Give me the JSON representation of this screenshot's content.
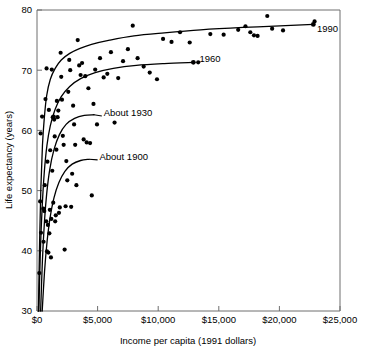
{
  "chart_data": {
    "type": "scatter",
    "title": "",
    "xlabel": "Income per capita (1991 dollars)",
    "ylabel": "Life expectancy (years)",
    "xlim": [
      0,
      25000
    ],
    "ylim": [
      30,
      80
    ],
    "grid": false,
    "legend_position": "inline-curve-labels",
    "x_ticks": [
      0,
      5000,
      10000,
      15000,
      20000,
      25000
    ],
    "x_tick_labels": [
      "$0",
      "$5,000",
      "$10,000",
      "$15,000",
      "$20,000",
      "$25,000"
    ],
    "y_ticks": [
      30,
      40,
      50,
      60,
      70,
      80
    ],
    "y_tick_labels": [
      "30",
      "40",
      "50",
      "60",
      "70",
      "80"
    ],
    "annotations": [
      {
        "text": "1990",
        "x": 23100,
        "y": 76.4
      },
      {
        "text": "1960",
        "x": 13400,
        "y": 71.3
      },
      {
        "text": "About 1930",
        "x": 5500,
        "y": 62.4
      },
      {
        "text": "About 1900",
        "x": 5150,
        "y": 55.1
      }
    ],
    "series": [
      {
        "name": "1990 scatter",
        "type": "scatter",
        "points": [
          [
            190,
            36.3
          ],
          [
            260,
            48.2
          ],
          [
            300,
            59.5
          ],
          [
            330,
            43.0
          ],
          [
            420,
            62.3
          ],
          [
            520,
            47.0
          ],
          [
            540,
            41.5
          ],
          [
            600,
            46.6
          ],
          [
            640,
            50.9
          ],
          [
            700,
            65.2
          ],
          [
            760,
            44.9
          ],
          [
            790,
            70.3
          ],
          [
            820,
            39.9
          ],
          [
            860,
            54.8
          ],
          [
            900,
            44.3
          ],
          [
            940,
            39.7
          ],
          [
            980,
            63.4
          ],
          [
            1020,
            42.9
          ],
          [
            1060,
            46.8
          ],
          [
            1090,
            56.7
          ],
          [
            1150,
            38.9
          ],
          [
            1180,
            45.3
          ],
          [
            1220,
            70.1
          ],
          [
            1260,
            53.3
          ],
          [
            1300,
            62.2
          ],
          [
            1340,
            48.0
          ],
          [
            1380,
            62.3
          ],
          [
            1420,
            61.8
          ],
          [
            1460,
            59.0
          ],
          [
            1500,
            44.9
          ],
          [
            1550,
            45.9
          ],
          [
            1600,
            56.8
          ],
          [
            1640,
            64.9
          ],
          [
            1700,
            62.2
          ],
          [
            1760,
            63.3
          ],
          [
            1810,
            46.3
          ],
          [
            1880,
            47.2
          ],
          [
            1950,
            72.9
          ],
          [
            2000,
            68.9
          ],
          [
            2060,
            65.1
          ],
          [
            2130,
            59.1
          ],
          [
            2200,
            57.6
          ],
          [
            2280,
            40.2
          ],
          [
            2360,
            47.4
          ],
          [
            2420,
            54.9
          ],
          [
            2500,
            51.7
          ],
          [
            2580,
            66.4
          ],
          [
            2660,
            71.7
          ],
          [
            2740,
            70.0
          ],
          [
            2820,
            47.3
          ],
          [
            2900,
            52.8
          ],
          [
            2980,
            64.1
          ],
          [
            3060,
            61.0
          ],
          [
            3150,
            57.6
          ],
          [
            3250,
            50.9
          ],
          [
            3360,
            75.0
          ],
          [
            3480,
            70.8
          ],
          [
            3600,
            69.2
          ],
          [
            3720,
            71.2
          ],
          [
            3850,
            58.5
          ],
          [
            3980,
            69.0
          ],
          [
            4100,
            58.0
          ],
          [
            4240,
            67.0
          ],
          [
            4380,
            57.9
          ],
          [
            4520,
            49.2
          ],
          [
            4660,
            64.4
          ],
          [
            4800,
            70.1
          ],
          [
            4950,
            61.0
          ],
          [
            5200,
            72.0
          ],
          [
            5500,
            68.8
          ],
          [
            5800,
            69.4
          ],
          [
            6100,
            73.0
          ],
          [
            6400,
            61.3
          ],
          [
            6700,
            68.7
          ],
          [
            7100,
            71.5
          ],
          [
            7500,
            73.5
          ],
          [
            7900,
            77.4
          ],
          [
            8300,
            72.0
          ],
          [
            8800,
            70.6
          ],
          [
            9300,
            69.6
          ],
          [
            9900,
            68.5
          ],
          [
            10400,
            75.2
          ],
          [
            11100,
            74.7
          ],
          [
            11800,
            76.3
          ],
          [
            12600,
            74.6
          ],
          [
            13300,
            71.3
          ],
          [
            14300,
            76.0
          ],
          [
            15400,
            75.9
          ],
          [
            16600,
            76.7
          ],
          [
            17200,
            77.3
          ],
          [
            17600,
            76.3
          ],
          [
            17900,
            75.8
          ],
          [
            18200,
            75.7
          ],
          [
            19000,
            79.0
          ],
          [
            19400,
            76.9
          ],
          [
            20300,
            76.6
          ],
          [
            22900,
            78.1
          ]
        ]
      },
      {
        "name": "1990 fitted curve",
        "type": "line",
        "points": [
          [
            120,
            30.0
          ],
          [
            220,
            42.0
          ],
          [
            320,
            50.5
          ],
          [
            450,
            57.5
          ],
          [
            600,
            62.0
          ],
          [
            800,
            65.8
          ],
          [
            1100,
            68.5
          ],
          [
            1500,
            70.3
          ],
          [
            2000,
            71.7
          ],
          [
            2700,
            72.8
          ],
          [
            3500,
            73.6
          ],
          [
            4500,
            74.3
          ],
          [
            6000,
            75.0
          ],
          [
            8000,
            75.7
          ],
          [
            10500,
            76.2
          ],
          [
            13500,
            76.7
          ],
          [
            17000,
            77.1
          ],
          [
            20500,
            77.4
          ],
          [
            22800,
            77.6
          ]
        ]
      },
      {
        "name": "1960 fitted curve",
        "type": "line",
        "points": [
          [
            150,
            30.0
          ],
          [
            280,
            40.0
          ],
          [
            420,
            47.0
          ],
          [
            600,
            53.0
          ],
          [
            820,
            57.5
          ],
          [
            1100,
            60.8
          ],
          [
            1500,
            63.5
          ],
          [
            2000,
            65.6
          ],
          [
            2700,
            67.3
          ],
          [
            3600,
            68.6
          ],
          [
            4800,
            69.6
          ],
          [
            6300,
            70.3
          ],
          [
            8200,
            70.8
          ],
          [
            10500,
            71.1
          ],
          [
            12900,
            71.3
          ]
        ]
      },
      {
        "name": "About 1930 fitted curve",
        "type": "line",
        "points": [
          [
            300,
            30.0
          ],
          [
            450,
            38.5
          ],
          [
            620,
            45.0
          ],
          [
            800,
            49.5
          ],
          [
            1050,
            53.5
          ],
          [
            1400,
            56.8
          ],
          [
            1850,
            59.3
          ],
          [
            2400,
            61.0
          ],
          [
            3100,
            62.0
          ],
          [
            3900,
            62.5
          ],
          [
            4700,
            62.6
          ]
        ]
      },
      {
        "name": "About 1900 fitted curve",
        "type": "line",
        "points": [
          [
            430,
            30.0
          ],
          [
            620,
            36.5
          ],
          [
            830,
            41.5
          ],
          [
            1080,
            45.5
          ],
          [
            1400,
            48.8
          ],
          [
            1800,
            51.3
          ],
          [
            2300,
            53.2
          ],
          [
            2900,
            54.4
          ],
          [
            3600,
            55.0
          ],
          [
            4300,
            55.2
          ]
        ]
      }
    ]
  },
  "axes": {
    "x_title": "Income per capita (1991 dollars)",
    "y_title": "Life expectancy (years)"
  }
}
